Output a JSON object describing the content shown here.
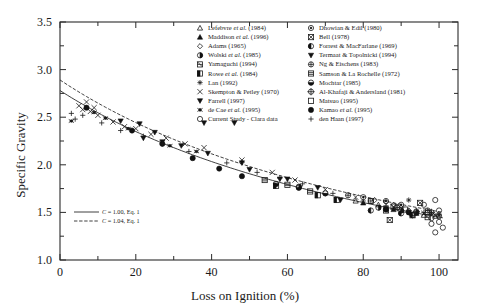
{
  "chart_data": {
    "type": "scatter",
    "title": "",
    "xlabel": "Loss on Ignition (%)",
    "ylabel": "Specific Gravity",
    "xlim": [
      0,
      105
    ],
    "ylim": [
      1.0,
      3.5
    ],
    "xticks": [
      0,
      20,
      40,
      60,
      80,
      100
    ],
    "yticks": [
      "1.0",
      "1.5",
      "2.0",
      "2.5",
      "3.0",
      "3.5"
    ],
    "grid": false,
    "legend_position": "top-right",
    "fit_legend_position": "inner-bottom-left",
    "fit_curves": [
      {
        "label": "C = 1.00, Eq. 1",
        "style": "solid",
        "C": 1.0
      },
      {
        "label": "C = 1.04, Eq. 1",
        "style": "dashed",
        "C": 1.04
      }
    ],
    "series": [
      {
        "name": "Lefebvre et al. (1984)",
        "marker": "triangle-open",
        "points": [
          [
            78,
            1.62
          ],
          [
            84,
            1.58
          ],
          [
            96,
            1.47
          ],
          [
            99,
            1.46
          ]
        ]
      },
      {
        "name": "Maddison et al. (1996)",
        "marker": "triangle-filled",
        "points": [
          [
            80,
            1.6
          ],
          [
            88,
            1.53
          ],
          [
            94,
            1.49
          ]
        ]
      },
      {
        "name": "Adams (1965)",
        "marker": "diamond-open",
        "points": [
          [
            83,
            1.63
          ],
          [
            86,
            1.61
          ],
          [
            88,
            1.58
          ],
          [
            90,
            1.55
          ],
          [
            92,
            1.52
          ]
        ]
      },
      {
        "name": "Wolski et al. (1985)",
        "marker": "circle-half",
        "points": [
          [
            63,
            1.77
          ],
          [
            84,
            1.55
          ],
          [
            90,
            1.52
          ],
          [
            94,
            1.5
          ]
        ]
      },
      {
        "name": "Yamaguchi (1994)",
        "marker": "square-hatch",
        "points": [
          [
            86,
            1.52
          ],
          [
            93,
            1.47
          ],
          [
            97,
            1.45
          ]
        ]
      },
      {
        "name": "Rowe et al. (1984)",
        "marker": "square-half",
        "points": [
          [
            57,
            1.78
          ],
          [
            68,
            1.68
          ],
          [
            73,
            1.63
          ]
        ]
      },
      {
        "name": "Lan (1992)",
        "marker": "asterisk",
        "points": [
          [
            92,
            1.63
          ],
          [
            98,
            1.49
          ],
          [
            100,
            1.47
          ]
        ]
      },
      {
        "name": "Skempton & Petley (1970)",
        "marker": "cross-x",
        "points": [
          [
            5,
            2.62
          ],
          [
            6,
            2.58
          ],
          [
            7,
            2.66
          ],
          [
            8,
            2.56
          ],
          [
            9,
            2.6
          ],
          [
            10,
            2.52
          ],
          [
            14,
            2.45
          ],
          [
            17,
            2.4
          ],
          [
            20,
            2.38
          ],
          [
            24,
            2.32
          ],
          [
            28,
            2.28
          ],
          [
            33,
            2.22
          ],
          [
            38,
            2.18
          ],
          [
            48,
            2.05
          ],
          [
            56,
            1.92
          ],
          [
            62,
            1.84
          ],
          [
            70,
            1.74
          ],
          [
            78,
            1.66
          ],
          [
            88,
            1.56
          ],
          [
            96,
            1.49
          ],
          [
            99,
            1.47
          ]
        ]
      },
      {
        "name": "Farrell (1997)",
        "marker": "triangle-down-filled",
        "points": [
          [
            22,
            2.28
          ],
          [
            27,
            2.24
          ],
          [
            32,
            2.2
          ],
          [
            38,
            2.44
          ],
          [
            46,
            2.44
          ],
          [
            50,
            1.95
          ],
          [
            58,
            1.85
          ],
          [
            68,
            1.76
          ],
          [
            74,
            1.63
          ],
          [
            86,
            1.54
          ]
        ]
      },
      {
        "name": "de Cae et al. (1995)",
        "marker": "star-small",
        "points": [
          [
            3,
            2.46
          ],
          [
            9,
            2.55
          ],
          [
            12,
            2.49
          ],
          [
            18,
            2.38
          ],
          [
            29,
            2.2
          ],
          [
            36,
            2.14
          ]
        ]
      },
      {
        "name": "Current Study - Clara data",
        "marker": "circle-open",
        "points": [
          [
            96,
            1.58
          ],
          [
            97,
            1.5
          ],
          [
            98,
            1.44
          ],
          [
            98,
            1.38
          ],
          [
            99,
            1.63
          ],
          [
            100,
            1.52
          ],
          [
            100,
            1.46
          ],
          [
            100,
            1.4
          ],
          [
            101,
            1.34
          ],
          [
            99,
            1.29
          ]
        ]
      },
      {
        "name": "Dhowian & Edil (1980)",
        "marker": "circle-dot",
        "points": [
          [
            80,
            1.66
          ],
          [
            86,
            1.62
          ],
          [
            90,
            1.58
          ]
        ]
      },
      {
        "name": "Bell (1978)",
        "marker": "square-x",
        "points": [
          [
            87,
            1.42
          ],
          [
            95,
            1.6
          ]
        ]
      },
      {
        "name": "Forrest & MacFarlane (1969)",
        "marker": "circle-halfdark",
        "points": [
          [
            82,
            1.52
          ],
          [
            90,
            1.49
          ],
          [
            93,
            1.47
          ]
        ]
      },
      {
        "name": "Termaat & Topolnicki (1994)",
        "marker": "triangle-down-solid",
        "points": [
          [
            16,
            2.46
          ],
          [
            21,
            2.43
          ],
          [
            25,
            2.34
          ],
          [
            39,
            2.12
          ],
          [
            48,
            2.02
          ],
          [
            60,
            1.85
          ]
        ]
      },
      {
        "name": "Ng & Eischens (1983)",
        "marker": "circle-cross",
        "points": [
          [
            76,
            1.68
          ],
          [
            82,
            1.62
          ],
          [
            97,
            1.52
          ]
        ]
      },
      {
        "name": "Samson & La Rochelle (1972)",
        "marker": "square-grid",
        "points": [
          [
            54,
            1.84
          ],
          [
            60,
            1.79
          ],
          [
            66,
            1.72
          ]
        ]
      },
      {
        "name": "Mochtar (1985)",
        "marker": "circle-bottomfill",
        "points": [
          [
            57,
            1.8
          ],
          [
            63,
            1.76
          ],
          [
            70,
            1.7
          ]
        ]
      },
      {
        "name": "Al-Khafaji & Andersland (1981)",
        "marker": "circle-plus",
        "points": [
          [
            89,
            1.55
          ],
          [
            94,
            1.51
          ],
          [
            98,
            1.5
          ]
        ]
      },
      {
        "name": "Matsuo (1995)",
        "marker": "square-open",
        "points": [
          [
            82,
            1.62
          ],
          [
            88,
            1.56
          ],
          [
            91,
            1.53
          ]
        ]
      },
      {
        "name": "Kamao et al. (1995)",
        "marker": "circle-filled",
        "points": [
          [
            7,
            2.6
          ],
          [
            19,
            2.36
          ],
          [
            27,
            2.22
          ],
          [
            35,
            2.07
          ],
          [
            42,
            1.96
          ],
          [
            48,
            1.88
          ],
          [
            86,
            1.53
          ],
          [
            92,
            1.5
          ]
        ]
      },
      {
        "name": "den Haan (1997)",
        "marker": "plus",
        "points": [
          [
            3,
            2.54
          ],
          [
            4,
            2.48
          ],
          [
            6,
            2.52
          ],
          [
            11,
            2.44
          ],
          [
            16,
            2.36
          ],
          [
            22,
            2.3
          ],
          [
            27,
            2.22
          ],
          [
            34,
            2.14
          ],
          [
            44,
            2.02
          ],
          [
            52,
            1.92
          ],
          [
            58,
            1.86
          ],
          [
            64,
            1.8
          ],
          [
            72,
            1.7
          ],
          [
            80,
            1.62
          ],
          [
            86,
            1.57
          ],
          [
            92,
            1.52
          ],
          [
            96,
            1.5
          ],
          [
            100,
            1.48
          ]
        ]
      }
    ]
  },
  "legend": {
    "column_left": [
      {
        "marker": "triangle-open",
        "label": "Lefebvre ",
        "italic": "et al.",
        "tail": " (1984)"
      },
      {
        "marker": "triangle-filled",
        "label": "Maddison ",
        "italic": "et al.",
        "tail": " (1996)"
      },
      {
        "marker": "diamond-open",
        "label": "Adams (1965)",
        "italic": "",
        "tail": ""
      },
      {
        "marker": "circle-half",
        "label": "Wolski ",
        "italic": "et al.",
        "tail": " (1985)"
      },
      {
        "marker": "square-hatch",
        "label": "Yamaguchi (1994)",
        "italic": "",
        "tail": ""
      },
      {
        "marker": "square-half",
        "label": "Rowe ",
        "italic": "et al.",
        "tail": " (1984)"
      },
      {
        "marker": "asterisk",
        "label": "Lan (1992)",
        "italic": "",
        "tail": ""
      },
      {
        "marker": "cross-x",
        "label": "Skempton & Petley (1970)",
        "italic": "",
        "tail": ""
      },
      {
        "marker": "triangle-down-filled",
        "label": "Farrell (1997)",
        "italic": "",
        "tail": ""
      },
      {
        "marker": "star-small",
        "label": "de Cae ",
        "italic": "et al.",
        "tail": " (1995)"
      },
      {
        "marker": "circle-open",
        "label": "Current Study - Clara data",
        "italic": "",
        "tail": ""
      }
    ],
    "column_right": [
      {
        "marker": "circle-dot",
        "label": "Dhowian & Edil (1980)",
        "italic": "",
        "tail": ""
      },
      {
        "marker": "square-x",
        "label": "Bell (1978)",
        "italic": "",
        "tail": ""
      },
      {
        "marker": "circle-halfdark",
        "label": "Forrest & MacFarlane (1969)",
        "italic": "",
        "tail": ""
      },
      {
        "marker": "triangle-down-solid",
        "label": "Termaat & Topolnicki (1994)",
        "italic": "",
        "tail": ""
      },
      {
        "marker": "circle-cross",
        "label": "Ng & Eischens (1983)",
        "italic": "",
        "tail": ""
      },
      {
        "marker": "square-grid",
        "label": "Samson & La Rochelle (1972)",
        "italic": "",
        "tail": ""
      },
      {
        "marker": "circle-bottomfill",
        "label": "Mochtar (1985)",
        "italic": "",
        "tail": ""
      },
      {
        "marker": "circle-plus",
        "label": "Al-Khafaji & Andersland (1981)",
        "italic": "",
        "tail": ""
      },
      {
        "marker": "square-open",
        "label": "Matsuo (1995)",
        "italic": "",
        "tail": ""
      },
      {
        "marker": "circle-filled",
        "label": "Kamao ",
        "italic": "et al.",
        "tail": " (1995)"
      },
      {
        "marker": "plus",
        "label": "den Haan (1997)",
        "italic": "",
        "tail": ""
      }
    ]
  },
  "colors": {
    "ink": "#1a1a1a",
    "axis": "#2b2b2b",
    "background": "#ffffff"
  }
}
